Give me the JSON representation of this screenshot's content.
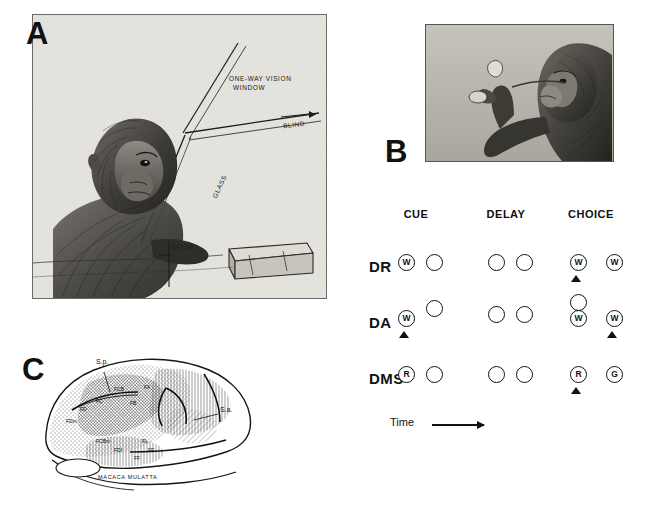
{
  "figure": {
    "panels": [
      {
        "id": "A",
        "letter": "A",
        "caption": ""
      },
      {
        "id": "B",
        "letter": "B",
        "caption": ""
      },
      {
        "id": "C",
        "letter": "C",
        "caption": ""
      }
    ]
  },
  "panel_a": {
    "letter": "A",
    "labels": [
      {
        "text": "ONE-WAY VISION",
        "x": 196,
        "y": 62,
        "rotate": 0
      },
      {
        "text": "WINDOW",
        "x": 200,
        "y": 71,
        "rotate": 0
      },
      {
        "text": "BLIND",
        "x": 252,
        "y": 108,
        "rotate": -22
      },
      {
        "text": "GLASS",
        "x": 177,
        "y": 170,
        "rotate": -34
      },
      {
        "text": "DOOR",
        "x": 139,
        "y": 231,
        "rotate": 0
      }
    ]
  },
  "panel_b": {
    "letter": "B"
  },
  "task_diagram": {
    "columns": [
      "CUE",
      "DELAY",
      "CHOICE"
    ],
    "time_label": "Time",
    "rows": [
      {
        "label": "DR",
        "phases": [
          {
            "name": "cue",
            "wells": [
              {
                "mark": "W",
                "cue": true
              },
              {
                "mark": "",
                "cue": false
              }
            ],
            "pointer": null
          },
          {
            "name": "delay",
            "wells": [
              {
                "mark": "",
                "cue": false
              },
              {
                "mark": "",
                "cue": false
              }
            ],
            "pointer": null
          },
          {
            "name": "choice",
            "wells": [
              {
                "mark": "W",
                "cue": false
              },
              {
                "mark": "W",
                "cue": false
              }
            ],
            "pointer": 0
          }
        ]
      },
      {
        "label": "DA",
        "phases": [
          {
            "name": "cue",
            "wells": [
              {
                "mark": "W",
                "cue": true
              },
              {
                "mark": "",
                "cue": false
              }
            ],
            "pointer": 0
          },
          {
            "name": "delay",
            "wells": [
              {
                "mark": "",
                "cue": false
              },
              {
                "mark": "",
                "cue": false
              }
            ],
            "pointer": null
          },
          {
            "name": "choice",
            "wells": [
              {
                "mark": "W",
                "cue": false
              },
              {
                "mark": "W",
                "cue": false
              }
            ],
            "pointer": 1
          }
        ]
      },
      {
        "label": "DMS",
        "phases": [
          {
            "name": "cue",
            "wells": [
              {
                "mark": "R",
                "cue": true
              },
              {
                "mark": "",
                "cue": false
              }
            ],
            "pointer": null
          },
          {
            "name": "delay",
            "wells": [
              {
                "mark": "",
                "cue": false
              },
              {
                "mark": "",
                "cue": false
              }
            ],
            "pointer": null
          },
          {
            "name": "choice",
            "wells": [
              {
                "mark": "R",
                "cue": false
              },
              {
                "mark": "G",
                "cue": false
              }
            ],
            "pointer": 0
          }
        ]
      }
    ],
    "well_offsets": {
      "cue": [
        28,
        56
      ],
      "delay": [
        118,
        146
      ],
      "choice": [
        200,
        236
      ]
    },
    "row_y": [
      56,
      112,
      168
    ]
  },
  "panel_c": {
    "letter": "C",
    "species": "MACACA MULATTA",
    "labels": [
      {
        "text": "S.p.",
        "x": 62,
        "y": 16
      },
      {
        "text": "S.a.",
        "x": 183,
        "y": 62
      },
      {
        "text": "FCB",
        "x": 78,
        "y": 42
      },
      {
        "text": "FA",
        "x": 104,
        "y": 40
      },
      {
        "text": "FB",
        "x": 90,
        "y": 55
      },
      {
        "text": "FC",
        "x": 60,
        "y": 52
      },
      {
        "text": "FD",
        "x": 44,
        "y": 59
      },
      {
        "text": "FDm",
        "x": 32,
        "y": 72
      },
      {
        "text": "FCBm",
        "x": 62,
        "y": 92
      },
      {
        "text": "FL",
        "x": 104,
        "y": 92
      },
      {
        "text": "FDI",
        "x": 78,
        "y": 100
      },
      {
        "text": "FE",
        "x": 110,
        "y": 101
      },
      {
        "text": "FF",
        "x": 96,
        "y": 108
      }
    ]
  }
}
